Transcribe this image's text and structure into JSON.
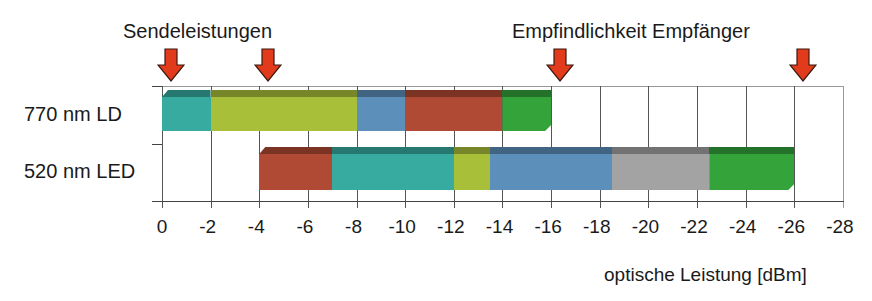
{
  "header": {
    "left_annotation": "Sendeleistungen",
    "right_annotation": "Empfindlichkeit Empfänger"
  },
  "rows": [
    {
      "label": "770 nm LD"
    },
    {
      "label": "520 nm LED"
    }
  ],
  "axis": {
    "xlabel": "optische Leistung [dBm]",
    "ticks": [
      "0",
      "-2",
      "-4",
      "-6",
      "-8",
      "-10",
      "-12",
      "-14",
      "-16",
      "-18",
      "-20",
      "-22",
      "-24",
      "-26",
      "-28"
    ]
  },
  "colors": {
    "arrow": "#e23b1c",
    "teal": "#38aba0",
    "yellowgreen": "#a8bf3a",
    "blue": "#5c8fba",
    "red": "#b04a34",
    "green": "#34a33a",
    "gray": "#a3a3a3"
  },
  "chart_data": {
    "type": "bar",
    "subtype": "horizontal stacked range bars (3D)",
    "title": "",
    "xlabel": "optische Leistung [dBm]",
    "ylabel": "",
    "xlim": [
      0,
      -28
    ],
    "x_ticks": [
      0,
      -2,
      -4,
      -6,
      -8,
      -10,
      -12,
      -14,
      -16,
      -18,
      -20,
      -22,
      -24,
      -26,
      -28
    ],
    "grid": true,
    "categories": [
      "770 nm LD",
      "520 nm LED"
    ],
    "series": [
      {
        "name": "770 nm LD",
        "segments": [
          {
            "from": 0,
            "to": -2,
            "color": "#38aba0"
          },
          {
            "from": -2,
            "to": -8,
            "color": "#a8bf3a"
          },
          {
            "from": -8,
            "to": -10,
            "color": "#5c8fba"
          },
          {
            "from": -10,
            "to": -14,
            "color": "#b04a34"
          },
          {
            "from": -14,
            "to": -16,
            "color": "#34a33a"
          }
        ]
      },
      {
        "name": "520 nm LED",
        "segments": [
          {
            "from": -4,
            "to": -7,
            "color": "#b04a34"
          },
          {
            "from": -7,
            "to": -12,
            "color": "#38aba0"
          },
          {
            "from": -12,
            "to": -13.5,
            "color": "#a8bf3a"
          },
          {
            "from": -13.5,
            "to": -18.5,
            "color": "#5c8fba"
          },
          {
            "from": -18.5,
            "to": -22.5,
            "color": "#a3a3a3"
          },
          {
            "from": -22.5,
            "to": -26,
            "color": "#34a33a"
          }
        ]
      }
    ],
    "annotations": [
      {
        "text": "Sendeleistungen",
        "arrows_at": [
          0,
          -4
        ]
      },
      {
        "text": "Empfindlichkeit Empfänger",
        "arrows_at": [
          -16,
          -26
        ]
      }
    ]
  }
}
